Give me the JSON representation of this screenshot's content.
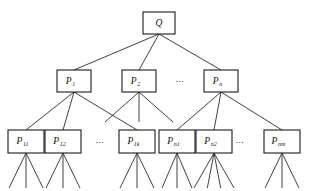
{
  "diagram": {
    "type": "hierarchical-tree",
    "background_color": "#ffffff",
    "line_color": "#2b2b2b",
    "box_stroke_color": "#1a1a1a",
    "box_fill_color": "#ffffff",
    "text_color": "#111111",
    "levels": 3,
    "root": {
      "id": "Q",
      "base": "Q",
      "subscript": "",
      "x": 143,
      "y": 12,
      "w": 32,
      "h": 22
    },
    "level2": [
      {
        "id": "P1",
        "base": "P",
        "subscript": "1",
        "x": 57,
        "y": 70,
        "w": 34,
        "h": 22
      },
      {
        "id": "P2",
        "base": "P",
        "subscript": "2",
        "x": 122,
        "y": 70,
        "w": 34,
        "h": 22
      },
      {
        "id": "Pn",
        "base": "P",
        "subscript": "n",
        "x": 204,
        "y": 70,
        "w": 34,
        "h": 22
      }
    ],
    "level2_ellipsis": [
      {
        "id": "ell-level2",
        "text": "…",
        "x": 180,
        "y": 80
      }
    ],
    "level3": [
      {
        "id": "P11",
        "base": "P",
        "subscript": "11",
        "x": 8,
        "y": 130,
        "w": 36,
        "h": 23,
        "parent": "P1"
      },
      {
        "id": "P12",
        "base": "P",
        "subscript": "12",
        "x": 45,
        "y": 130,
        "w": 36,
        "h": 23,
        "parent": "P1"
      },
      {
        "id": "P1k",
        "base": "P",
        "subscript": "1k",
        "x": 119,
        "y": 130,
        "w": 36,
        "h": 23,
        "parent": "P1"
      },
      {
        "id": "Pn1",
        "base": "P",
        "subscript": "n1",
        "x": 159,
        "y": 130,
        "w": 36,
        "h": 23,
        "parent": "Pn"
      },
      {
        "id": "Pn2",
        "base": "P",
        "subscript": "n2",
        "x": 196,
        "y": 130,
        "w": 36,
        "h": 23,
        "parent": "Pn"
      },
      {
        "id": "Pnm",
        "base": "P",
        "subscript": "nm",
        "x": 264,
        "y": 130,
        "w": 36,
        "h": 23,
        "parent": "Pn"
      }
    ],
    "level3_ellipsis": [
      {
        "id": "ell-level3-left",
        "text": "…",
        "x": 100,
        "y": 141
      },
      {
        "id": "ell-level3-right",
        "text": "…",
        "x": 240,
        "y": 141
      }
    ],
    "edges_root_to_level2": [
      {
        "from": "Q",
        "to": "P1"
      },
      {
        "from": "Q",
        "to": "P2"
      },
      {
        "from": "Q",
        "to": "Pn"
      }
    ],
    "edges_level2_to_level3": [
      {
        "from": "P1",
        "to": "P11"
      },
      {
        "from": "P1",
        "to": "P12"
      },
      {
        "from": "P1",
        "to": "P1k"
      },
      {
        "from": "Pn",
        "to": "Pn1"
      },
      {
        "from": "Pn",
        "to": "Pn2"
      },
      {
        "from": "Pn",
        "to": "Pnm"
      }
    ],
    "dangling_stubs_P2": [
      {
        "parent": "P2",
        "dx": -34,
        "dy": 30
      },
      {
        "parent": "P2",
        "dx": 0,
        "dy": 30
      },
      {
        "parent": "P2",
        "dx": 34,
        "dy": 30
      }
    ],
    "leaf_fans": [
      {
        "parent": "P11",
        "count": 3,
        "spread": 17,
        "depth": 35
      },
      {
        "parent": "P12",
        "count": 3,
        "spread": 17,
        "depth": 35
      },
      {
        "parent": "P1k",
        "count": 3,
        "spread": 17,
        "depth": 35
      },
      {
        "parent": "Pn1",
        "count": 3,
        "spread": 15,
        "depth": 35
      },
      {
        "parent": "Pn2",
        "count": 4,
        "spread": 20,
        "depth": 35
      },
      {
        "parent": "Pnm",
        "count": 3,
        "spread": 17,
        "depth": 35
      }
    ]
  }
}
